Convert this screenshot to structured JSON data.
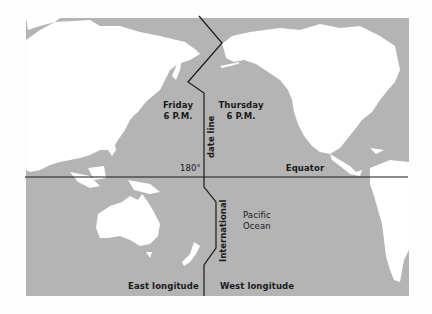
{
  "map": {
    "title": "International date line map (Pacific Ocean)",
    "colors": {
      "ocean": "#b4b4b4",
      "land": "#ffffff",
      "lines": "#1a1a1a",
      "background": "#fdfdfd"
    },
    "labels": {
      "west_side_day": "Friday",
      "west_side_time": "6 P.M.",
      "east_side_day": "Thursday",
      "east_side_time": "6 P.M.",
      "date_line_upper": "date line",
      "date_line_lower": "International",
      "meridian": "180°",
      "equator": "Equator",
      "ocean_line1": "Pacific",
      "ocean_line2": "Ocean",
      "east_longitude": "East longitude",
      "west_longitude": "West longitude"
    }
  }
}
